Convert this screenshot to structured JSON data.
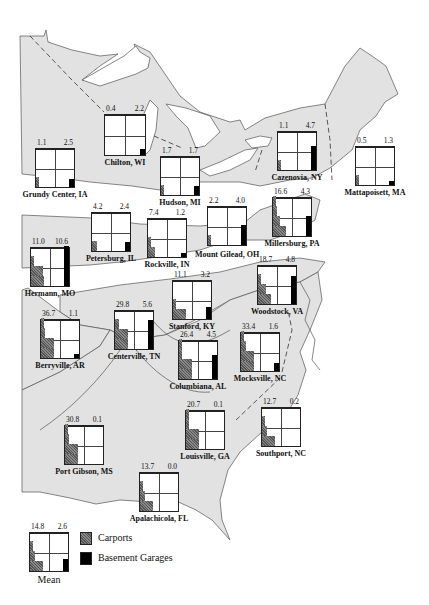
{
  "legend": {
    "carports_label": "Carports",
    "garages_label": "Basement Garages",
    "carport_color": "#666666",
    "garage_color": "#000000"
  },
  "chart_data": {
    "type": "small-multiples-map",
    "title": "",
    "series": [
      "Carports",
      "Basement Garages"
    ],
    "units": "percent",
    "locations": [
      {
        "name": "Chilton, WI",
        "carports": 0.4,
        "garages": 2.2
      },
      {
        "name": "Grundy Center, IA",
        "carports": 1.1,
        "garages": 2.5
      },
      {
        "name": "Hudson, MI",
        "carports": 1.7,
        "garages": 1.7
      },
      {
        "name": "Cazenovia, NY",
        "carports": 1.1,
        "garages": 4.7
      },
      {
        "name": "Mattapoisett, MA",
        "carports": 0.5,
        "garages": 1.3
      },
      {
        "name": "Petersburg, IL",
        "carports": 4.2,
        "garages": 2.4
      },
      {
        "name": "Rockville, IN",
        "carports": 7.4,
        "garages": 1.2
      },
      {
        "name": "Mount Gilead, OH",
        "carports": 2.2,
        "garages": 4.0
      },
      {
        "name": "Millersburg, PA",
        "carports": 16.6,
        "garages": 4.3
      },
      {
        "name": "Hermann, MO",
        "carports": 11.0,
        "garages": 10.6
      },
      {
        "name": "Stanford, KY",
        "carports": 11.1,
        "garages": 3.2
      },
      {
        "name": "Woodstock, VA",
        "carports": 18.7,
        "garages": 4.8
      },
      {
        "name": "Berryville, AR",
        "carports": 36.7,
        "garages": 1.1
      },
      {
        "name": "Centerville, TN",
        "carports": 29.8,
        "garages": 5.6
      },
      {
        "name": "Columbiana, AL",
        "carports": 26.4,
        "garages": 4.5
      },
      {
        "name": "Mocksville, NC",
        "carports": 33.4,
        "garages": 1.6
      },
      {
        "name": "Louisville, GA",
        "carports": 20.7,
        "garages": 0.1
      },
      {
        "name": "Southport, NC",
        "carports": 12.7,
        "garages": 0.2
      },
      {
        "name": "Port Gibson, MS",
        "carports": 30.8,
        "garages": 0.1
      },
      {
        "name": "Apalachicola, FL",
        "carports": 13.7,
        "garages": 0.0
      },
      {
        "name": "Mean",
        "carports": 14.8,
        "garages": 2.6
      }
    ]
  },
  "charts": [
    {
      "id": "chilton",
      "name": "Chilton, WI",
      "v1": "0.4",
      "v2": "2.2",
      "x": 104,
      "y": 114,
      "w": 42,
      "h": 42,
      "c": [
        0,
        0,
        0,
        0
      ],
      "g": 0.14,
      "label_dy": 4
    },
    {
      "id": "grundy",
      "name": "Grundy Center, IA",
      "v1": "1.1",
      "v2": "2.5",
      "x": 35,
      "y": 148,
      "w": 40,
      "h": 40,
      "c": [
        0.12,
        0,
        0,
        0
      ],
      "g": 0.2,
      "label_dy": 4
    },
    {
      "id": "hudson",
      "name": "Hudson, MI",
      "v1": "1.7",
      "v2": "1.7",
      "x": 160,
      "y": 156,
      "w": 40,
      "h": 40,
      "c": [
        0.22,
        0,
        0,
        0
      ],
      "g": 0.22,
      "label_dy": 4
    },
    {
      "id": "cazenovia",
      "name": "Cazenovia, NY",
      "v1": "1.1",
      "v2": "4.7",
      "x": 277,
      "y": 131,
      "w": 40,
      "h": 40,
      "c": [
        0.08,
        0,
        0,
        0
      ],
      "g": 0.6,
      "label_dy": 4
    },
    {
      "id": "mattapoisett",
      "name": "Mattapoisett, MA",
      "v1": "0.5",
      "v2": "1.3",
      "x": 355,
      "y": 146,
      "w": 40,
      "h": 40,
      "c": [
        0.07,
        0,
        0,
        0
      ],
      "g": 0.07,
      "label_dy": 4
    },
    {
      "id": "petersburg",
      "name": "Petersburg, IL",
      "v1": "4.2",
      "v2": "2.4",
      "x": 91,
      "y": 212,
      "w": 40,
      "h": 40,
      "c": [
        0.4,
        0,
        0,
        0
      ],
      "g": 0.22,
      "label_dy": 4
    },
    {
      "id": "rockville",
      "name": "Rockville, IN",
      "v1": "7.4",
      "v2": "1.2",
      "x": 147,
      "y": 218,
      "w": 40,
      "h": 40,
      "c": [
        0.55,
        0.15,
        0,
        0
      ],
      "g": 0.06,
      "label_dy": 4
    },
    {
      "id": "mountgilead",
      "name": "Mount Gilead, OH",
      "v1": "2.2",
      "v2": "4.0",
      "x": 207,
      "y": 206,
      "w": 40,
      "h": 40,
      "c": [
        0.2,
        0,
        0,
        0
      ],
      "g": 0.5,
      "label_dy": 6
    },
    {
      "id": "millersburg",
      "name": "Millersburg, PA",
      "v1": "16.6",
      "v2": "4.3",
      "x": 272,
      "y": 197,
      "w": 40,
      "h": 40,
      "c": [
        1,
        0.55,
        0.3,
        0.1
      ],
      "g": 0.5,
      "label_dy": 4
    },
    {
      "id": "hermann",
      "name": "Hermann, MO",
      "v1": "11.0",
      "v2": "10.6",
      "x": 30,
      "y": 247,
      "w": 40,
      "h": 40,
      "c": [
        1,
        0.9,
        0.1,
        0
      ],
      "g": 1,
      "label_dy": 4
    },
    {
      "id": "stanford",
      "name": "Stanford, KY",
      "v1": "11.1",
      "v2": "3.2",
      "x": 172,
      "y": 280,
      "w": 40,
      "h": 40,
      "c": [
        1,
        0.15,
        0,
        0
      ],
      "g": 0.3,
      "label_dy": 4
    },
    {
      "id": "woodstock",
      "name": "Woodstock, VA",
      "v1": "18.7",
      "v2": "4.8",
      "x": 257,
      "y": 265,
      "w": 40,
      "h": 40,
      "c": [
        1,
        0.6,
        0.15,
        0
      ],
      "g": 0.7,
      "label_dy": 4,
      "dash": true
    },
    {
      "id": "berryville",
      "name": "Berryville, AR",
      "v1": "36.7",
      "v2": "1.1",
      "x": 40,
      "y": 319,
      "w": 40,
      "h": 40,
      "c": [
        1,
        1,
        0.3,
        0.1
      ],
      "g": 0.1,
      "label_dy": 4
    },
    {
      "id": "centerville",
      "name": "Centerville, TN",
      "v1": "29.8",
      "v2": "5.6",
      "x": 114,
      "y": 310,
      "w": 40,
      "h": 40,
      "c": [
        1,
        1,
        0.3,
        0
      ],
      "g": 0.72,
      "label_dy": 4
    },
    {
      "id": "columbiana",
      "name": "Columbiana, AL",
      "v1": "26.4",
      "v2": "4.5",
      "x": 178,
      "y": 340,
      "w": 40,
      "h": 40,
      "c": [
        1,
        1,
        0.25,
        0.1
      ],
      "g": 0.6,
      "label_dy": 4
    },
    {
      "id": "mocksville",
      "name": "Mocksville, NC",
      "v1": "33.4",
      "v2": "1.6",
      "x": 240,
      "y": 332,
      "w": 40,
      "h": 40,
      "c": [
        1,
        1,
        0.35,
        0.15
      ],
      "g": 0.2,
      "label_dy": 4
    },
    {
      "id": "louisville",
      "name": "Louisville, GA",
      "v1": "20.7",
      "v2": "0.1",
      "x": 185,
      "y": 410,
      "w": 40,
      "h": 40,
      "c": [
        1,
        1,
        0.1,
        0.05
      ],
      "g": 0,
      "label_dy": 4
    },
    {
      "id": "southport",
      "name": "Southport, NC",
      "v1": "12.7",
      "v2": "0.2",
      "x": 261,
      "y": 407,
      "w": 40,
      "h": 40,
      "c": [
        1,
        0.35,
        0.1,
        0
      ],
      "g": 0,
      "label_dy": 4
    },
    {
      "id": "portgibson",
      "name": "Port Gibson, MS",
      "v1": "30.8",
      "v2": "0.1",
      "x": 64,
      "y": 425,
      "w": 40,
      "h": 40,
      "c": [
        1,
        1,
        0.3,
        0.1
      ],
      "g": 0,
      "label_dy": 4
    },
    {
      "id": "apalachicola",
      "name": "Apalachicola, FL",
      "v1": "13.7",
      "v2": "0.0",
      "x": 139,
      "y": 472,
      "w": 40,
      "h": 40,
      "c": [
        1,
        0.4,
        0.15,
        0
      ],
      "g": 0,
      "label_dy": 4
    },
    {
      "id": "mean",
      "name": "Mean",
      "v1": "14.8",
      "v2": "2.6",
      "x": 29,
      "y": 532,
      "w": 40,
      "h": 40,
      "c": [
        1,
        0.35,
        0.15,
        0
      ],
      "g": 0.3,
      "label_dy": 4,
      "plain": true
    }
  ]
}
